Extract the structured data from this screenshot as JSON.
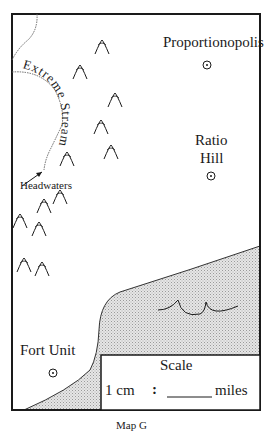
{
  "map": {
    "caption": "Map G",
    "cities": [
      {
        "name": "Proportionopolis",
        "x": 207,
        "y": 65
      },
      {
        "name": "Ratio",
        "name2": "Hill",
        "x": 211,
        "y": 176
      },
      {
        "name": "Fort Unit",
        "x": 53,
        "y": 370
      }
    ],
    "stream": {
      "label": "Extreme Stream",
      "headwaters_label": "Headwaters"
    },
    "scale": {
      "title": "Scale",
      "left": "1 cm",
      "separator": ":",
      "blank": "_____",
      "unit": "miles"
    },
    "colors": {
      "frame": "#1a1a1a",
      "water": "#d8d8d8",
      "stream": "#555555"
    },
    "icons": [
      "city-marker-icon",
      "mountain-icon",
      "wave-icon",
      "arrow-icon"
    ]
  }
}
